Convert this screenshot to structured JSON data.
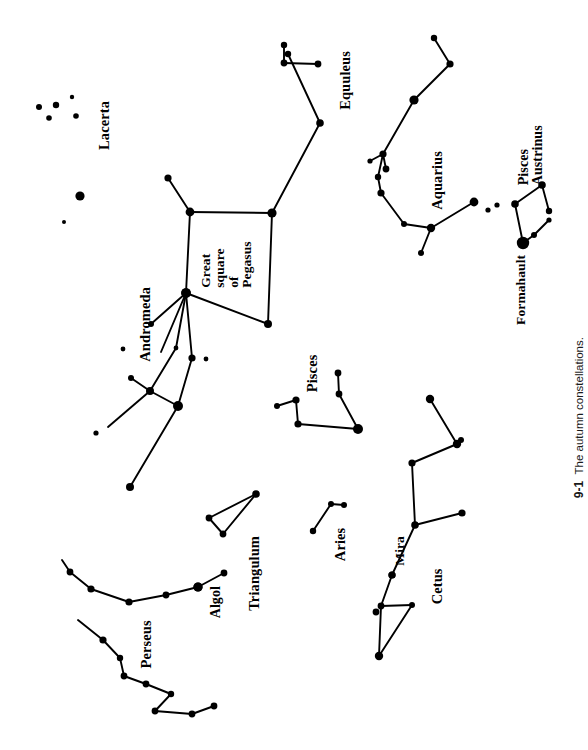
{
  "figure": {
    "caption_number": "9-1",
    "caption_text": "The autumn constellations.",
    "background_color": "#ffffff",
    "ink_color": "#000000",
    "width": 579,
    "height": 750
  },
  "labels": {
    "lacerta": "Lacerta",
    "equuleus": "Equuleus",
    "aquarius": "Aquarius",
    "pisces_austrinus": "Pisces\nAustrinus",
    "formahault": "Formahault",
    "great_square": "Great\nsquare\nof\nPegasus",
    "andromeda": "Andromeda",
    "pisces": "Pisces",
    "triangulum": "Triangulum",
    "aries": "Aries",
    "algol": "Algol",
    "perseus": "Perseus",
    "mira": "Mira",
    "cetus": "Cetus"
  },
  "chart_data": {
    "type": "scatter",
    "title": "The autumn constellations.",
    "xlabel": "",
    "ylabel": "",
    "xlim": [
      0,
      579
    ],
    "ylim": [
      0,
      750
    ],
    "grid": false,
    "legend": "none",
    "note": "Star chart of autumn constellations; dot radius encodes apparent magnitude (larger = brighter). Coordinates are in image pixel space, origin top-left.",
    "constellations": [
      {
        "name": "Lacerta",
        "label_pos": [
          104,
          125
        ],
        "label_rotation": -90,
        "stars": [
          {
            "x": 72,
            "y": 97,
            "r": 2.2
          },
          {
            "x": 39,
            "y": 107,
            "r": 3.0
          },
          {
            "x": 56,
            "y": 105,
            "r": 3.2
          },
          {
            "x": 49,
            "y": 118,
            "r": 2.8
          },
          {
            "x": 76,
            "y": 116,
            "r": 2.8
          },
          {
            "x": 80,
            "y": 196,
            "r": 4.6
          },
          {
            "x": 64,
            "y": 222,
            "r": 2.0
          }
        ],
        "lines": []
      },
      {
        "name": "Equuleus",
        "label_pos": [
          345,
          80
        ],
        "label_rotation": -90,
        "stars": [
          {
            "x": 284,
            "y": 45,
            "r": 3.2
          },
          {
            "x": 284,
            "y": 63,
            "r": 3.4
          },
          {
            "x": 318,
            "y": 64,
            "r": 3.4
          }
        ],
        "lines": [
          [
            284,
            45,
            284,
            63
          ],
          [
            284,
            63,
            318,
            64
          ]
        ]
      },
      {
        "name": "Pegasus",
        "label_pos": [
          224,
          265
        ],
        "label_rotation": -90,
        "stars": [
          {
            "x": 288,
            "y": 54,
            "r": 3.2
          },
          {
            "x": 320,
            "y": 123,
            "r": 3.8
          },
          {
            "x": 272,
            "y": 213,
            "r": 4.6
          },
          {
            "x": 190,
            "y": 212,
            "r": 4.4
          },
          {
            "x": 186,
            "y": 293,
            "r": 4.8
          },
          {
            "x": 268,
            "y": 324,
            "r": 4.0
          },
          {
            "x": 168,
            "y": 178,
            "r": 3.6
          },
          {
            "x": 151,
            "y": 324,
            "r": 3.0
          },
          {
            "x": 123,
            "y": 349,
            "r": 2.4
          }
        ],
        "lines": [
          [
            288,
            54,
            320,
            123
          ],
          [
            320,
            123,
            272,
            213
          ],
          [
            272,
            213,
            190,
            212
          ],
          [
            190,
            212,
            186,
            293
          ],
          [
            186,
            293,
            268,
            324
          ],
          [
            268,
            324,
            272,
            213
          ],
          [
            190,
            212,
            168,
            178
          ],
          [
            186,
            293,
            151,
            324
          ],
          [
            186,
            293,
            161,
            352
          ]
        ]
      },
      {
        "name": "Aquarius",
        "label_pos": [
          437,
          180
        ],
        "label_rotation": -90,
        "stars": [
          {
            "x": 434,
            "y": 38,
            "r": 3.2
          },
          {
            "x": 450,
            "y": 64,
            "r": 3.6
          },
          {
            "x": 414,
            "y": 100,
            "r": 4.6
          },
          {
            "x": 383,
            "y": 154,
            "r": 3.6
          },
          {
            "x": 370,
            "y": 161,
            "r": 2.6
          },
          {
            "x": 386,
            "y": 169,
            "r": 3.4
          },
          {
            "x": 378,
            "y": 177,
            "r": 3.2
          },
          {
            "x": 381,
            "y": 193,
            "r": 3.6
          },
          {
            "x": 404,
            "y": 224,
            "r": 3.0
          },
          {
            "x": 431,
            "y": 228,
            "r": 4.2
          },
          {
            "x": 474,
            "y": 202,
            "r": 4.4
          },
          {
            "x": 488,
            "y": 210,
            "r": 2.6
          },
          {
            "x": 421,
            "y": 253,
            "r": 3.0
          }
        ],
        "lines": [
          [
            434,
            38,
            450,
            64
          ],
          [
            450,
            64,
            414,
            100
          ],
          [
            414,
            100,
            383,
            154
          ],
          [
            383,
            154,
            370,
            161
          ],
          [
            383,
            154,
            386,
            169
          ],
          [
            383,
            154,
            378,
            177
          ],
          [
            378,
            177,
            381,
            193
          ],
          [
            381,
            193,
            404,
            224
          ],
          [
            404,
            224,
            431,
            228
          ],
          [
            431,
            228,
            474,
            202
          ],
          [
            431,
            228,
            421,
            253
          ]
        ]
      },
      {
        "name": "Pisces Austrinus",
        "label_pos": [
          533,
          155
        ],
        "label_rotation": -90,
        "stars": [
          {
            "x": 515,
            "y": 204,
            "r": 3.8
          },
          {
            "x": 542,
            "y": 185,
            "r": 3.8
          },
          {
            "x": 549,
            "y": 211,
            "r": 3.2
          },
          {
            "x": 549,
            "y": 220,
            "r": 2.6
          },
          {
            "x": 534,
            "y": 235,
            "r": 3.0
          },
          {
            "x": 523,
            "y": 243,
            "r": 6.2
          },
          {
            "x": 497,
            "y": 205,
            "r": 2.6
          }
        ],
        "lines": [
          [
            515,
            204,
            542,
            185
          ],
          [
            542,
            185,
            549,
            211
          ],
          [
            549,
            220,
            534,
            235
          ],
          [
            534,
            235,
            523,
            243
          ],
          [
            523,
            243,
            515,
            204
          ]
        ]
      },
      {
        "name": "Andromeda",
        "label_pos": [
          145,
          324
        ],
        "label_rotation": -90,
        "stars": [
          {
            "x": 186,
            "y": 293,
            "r": 4.8
          },
          {
            "x": 176,
            "y": 348,
            "r": 2.4
          },
          {
            "x": 192,
            "y": 358,
            "r": 3.6
          },
          {
            "x": 206,
            "y": 359,
            "r": 2.4
          },
          {
            "x": 150,
            "y": 391,
            "r": 4.0
          },
          {
            "x": 131,
            "y": 378,
            "r": 3.0
          },
          {
            "x": 178,
            "y": 406,
            "r": 5.0
          },
          {
            "x": 130,
            "y": 487,
            "r": 4.0
          },
          {
            "x": 96,
            "y": 433,
            "r": 2.6
          }
        ],
        "lines": [
          [
            186,
            293,
            176,
            348
          ],
          [
            176,
            348,
            150,
            391
          ],
          [
            186,
            293,
            192,
            358
          ],
          [
            192,
            358,
            178,
            406
          ],
          [
            150,
            391,
            178,
            406
          ],
          [
            150,
            391,
            131,
            378
          ],
          [
            150,
            391,
            108,
            427
          ],
          [
            178,
            406,
            130,
            487
          ]
        ]
      },
      {
        "name": "Pisces",
        "label_pos": [
          313,
          373
        ],
        "label_rotation": -90,
        "stars": [
          {
            "x": 338,
            "y": 373,
            "r": 3.4
          },
          {
            "x": 339,
            "y": 394,
            "r": 3.4
          },
          {
            "x": 358,
            "y": 429,
            "r": 5.0
          },
          {
            "x": 298,
            "y": 424,
            "r": 3.6
          },
          {
            "x": 296,
            "y": 400,
            "r": 3.6
          },
          {
            "x": 277,
            "y": 406,
            "r": 3.0
          }
        ],
        "lines": [
          [
            338,
            373,
            339,
            394
          ],
          [
            339,
            394,
            358,
            429
          ],
          [
            358,
            429,
            298,
            424
          ],
          [
            298,
            424,
            296,
            400
          ],
          [
            296,
            400,
            277,
            406
          ]
        ]
      },
      {
        "name": "Triangulum",
        "label_pos": [
          255,
          573
        ],
        "label_rotation": -90,
        "stars": [
          {
            "x": 256,
            "y": 494,
            "r": 3.8
          },
          {
            "x": 209,
            "y": 518,
            "r": 3.4
          },
          {
            "x": 223,
            "y": 534,
            "r": 3.4
          }
        ],
        "lines": [
          [
            256,
            494,
            209,
            518
          ],
          [
            209,
            518,
            223,
            534
          ],
          [
            223,
            534,
            256,
            494
          ]
        ]
      },
      {
        "name": "Aries",
        "label_pos": [
          341,
          543
        ],
        "label_rotation": -90,
        "stars": [
          {
            "x": 344,
            "y": 505,
            "r": 3.0
          },
          {
            "x": 331,
            "y": 504,
            "r": 3.0
          },
          {
            "x": 313,
            "y": 531,
            "r": 3.2
          }
        ],
        "lines": [
          [
            344,
            505,
            331,
            504
          ],
          [
            331,
            504,
            313,
            531
          ]
        ]
      },
      {
        "name": "Cetus",
        "label_pos": [
          437,
          585
        ],
        "label_rotation": -90,
        "stars": [
          {
            "x": 457,
            "y": 444,
            "r": 4.2
          },
          {
            "x": 461,
            "y": 440,
            "r": 3.0
          },
          {
            "x": 412,
            "y": 463,
            "r": 3.6
          },
          {
            "x": 415,
            "y": 525,
            "r": 3.8
          },
          {
            "x": 462,
            "y": 513,
            "r": 3.6
          },
          {
            "x": 392,
            "y": 575,
            "r": 3.6
          },
          {
            "x": 376,
            "y": 612,
            "r": 3.4
          },
          {
            "x": 381,
            "y": 606,
            "r": 3.4
          },
          {
            "x": 412,
            "y": 605,
            "r": 3.0
          },
          {
            "x": 379,
            "y": 656,
            "r": 4.2
          },
          {
            "x": 430,
            "y": 399,
            "r": 4.2
          }
        ],
        "lines": [
          [
            430,
            399,
            457,
            444
          ],
          [
            457,
            444,
            412,
            463
          ],
          [
            412,
            463,
            415,
            525
          ],
          [
            415,
            525,
            462,
            513
          ],
          [
            415,
            525,
            392,
            575
          ],
          [
            392,
            575,
            381,
            606
          ],
          [
            381,
            606,
            412,
            605
          ],
          [
            381,
            606,
            379,
            656
          ],
          [
            412,
            605,
            379,
            656
          ]
        ]
      },
      {
        "name": "Mira",
        "label_pos": [
          400,
          550
        ],
        "label_rotation": -90,
        "stars": [
          {
            "x": 392,
            "y": 575,
            "r": 3.6
          }
        ],
        "lines": []
      },
      {
        "name": "Perseus",
        "label_pos": [
          146,
          643
        ],
        "label_rotation": -90,
        "stars": [
          {
            "x": 198,
            "y": 587,
            "r": 4.6
          },
          {
            "x": 224,
            "y": 573,
            "r": 3.4
          },
          {
            "x": 166,
            "y": 595,
            "r": 3.4
          },
          {
            "x": 129,
            "y": 602,
            "r": 3.6
          },
          {
            "x": 91,
            "y": 589,
            "r": 3.6
          },
          {
            "x": 70,
            "y": 572,
            "r": 3.4
          },
          {
            "x": 103,
            "y": 640,
            "r": 3.6
          },
          {
            "x": 120,
            "y": 658,
            "r": 3.2
          },
          {
            "x": 124,
            "y": 676,
            "r": 3.4
          },
          {
            "x": 146,
            "y": 684,
            "r": 3.4
          },
          {
            "x": 171,
            "y": 694,
            "r": 3.2
          },
          {
            "x": 155,
            "y": 711,
            "r": 3.4
          },
          {
            "x": 192,
            "y": 714,
            "r": 3.4
          },
          {
            "x": 214,
            "y": 706,
            "r": 3.4
          }
        ],
        "lines": [
          [
            224,
            573,
            198,
            587
          ],
          [
            198,
            587,
            166,
            595
          ],
          [
            166,
            595,
            129,
            602
          ],
          [
            129,
            602,
            91,
            589
          ],
          [
            91,
            589,
            70,
            572
          ],
          [
            70,
            572,
            62,
            560
          ],
          [
            103,
            640,
            120,
            658
          ],
          [
            120,
            658,
            124,
            676
          ],
          [
            124,
            676,
            146,
            684
          ],
          [
            146,
            684,
            171,
            694
          ],
          [
            171,
            694,
            155,
            711
          ],
          [
            155,
            711,
            192,
            714
          ],
          [
            192,
            714,
            214,
            706
          ],
          [
            103,
            640,
            78,
            620
          ]
        ]
      },
      {
        "name": "Algol",
        "label_pos": [
          216,
          603
        ],
        "label_rotation": -90,
        "stars": [
          {
            "x": 198,
            "y": 587,
            "r": 4.6
          }
        ],
        "lines": []
      }
    ]
  }
}
